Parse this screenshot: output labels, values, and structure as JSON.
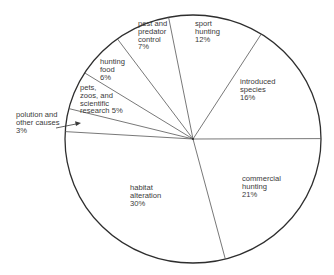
{
  "chart_data": {
    "type": "pie",
    "title": "",
    "units": "%",
    "start_angle_deg": -101,
    "direction": "clockwise",
    "center": [
      193,
      139
    ],
    "radius": [
      128,
      124
    ],
    "slices": [
      {
        "label": "sport hunting",
        "value": 12
      },
      {
        "label": "introduced species",
        "value": 16
      },
      {
        "label": "commercial hunting",
        "value": 21
      },
      {
        "label": "habitat alteration",
        "value": 30
      },
      {
        "label": "polution and other causes",
        "value": 3
      },
      {
        "label": "pets, zoos, and scientific research",
        "value": 5
      },
      {
        "label": "hunting food",
        "value": 6
      },
      {
        "label": "pest and predator control",
        "value": 7
      }
    ],
    "categories": [
      "sport hunting",
      "introduced species",
      "commercial hunting",
      "habitat alteration",
      "polution and other causes",
      "pets, zoos, and scientific research",
      "hunting food",
      "pest and predator control"
    ],
    "values": [
      12,
      16,
      21,
      30,
      3,
      5,
      6,
      7
    ],
    "legend": "none (labels placed inside slices)",
    "annotations": [
      "arrow from 'polution and other causes' label to its 3% slice"
    ]
  },
  "labels": {
    "sport": "sport\nhunting\n12%",
    "introduced": "introduced\nspecies\n16%",
    "commercial": "commercial\nhunting\n21%",
    "habitat": "habitat\nalteration\n30%",
    "pollution": "polution and\nother causes\n3%",
    "pets": "pets,\nzoos, and\nscientific\nresearch 5%",
    "hunting_food": "hunting\nfood\n6%",
    "pest": "pest and\npredator\ncontrol\n7%"
  },
  "colors": {
    "outline": "#2e2e2e",
    "spoke": "#555555",
    "fill": "#ffffff",
    "text": "#3a3a3a"
  }
}
